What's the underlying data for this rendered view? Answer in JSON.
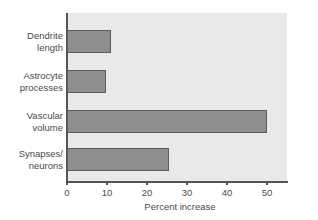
{
  "chart_data": {
    "type": "bar",
    "orientation": "horizontal",
    "title": "",
    "xlabel": "Percent increase",
    "ylabel": "",
    "categories": [
      "Dendrite length",
      "Astrocyte processes",
      "Vascular volume",
      "Synapses/neurons"
    ],
    "category_lines": [
      [
        "Dendrite",
        "length"
      ],
      [
        "Astrocyte",
        "processes"
      ],
      [
        "Vascular",
        "volume"
      ],
      [
        "Synapses/",
        "neurons"
      ]
    ],
    "values": [
      11,
      9.7,
      50,
      25.5
    ],
    "xlim": [
      0,
      55
    ],
    "xticks": [
      0,
      10,
      20,
      30,
      40,
      50
    ],
    "xticklabels": [
      "0",
      "10",
      "20",
      "30",
      "40",
      "50"
    ],
    "grid": false,
    "legend": null,
    "colors": {
      "bar_fill": "#8e8e8e",
      "bar_edge": "#5d5d5d",
      "plot_background": "#e9e9e9",
      "page_background": "#ffffff",
      "axis": "#555555",
      "text": "#4a4a4a"
    }
  }
}
